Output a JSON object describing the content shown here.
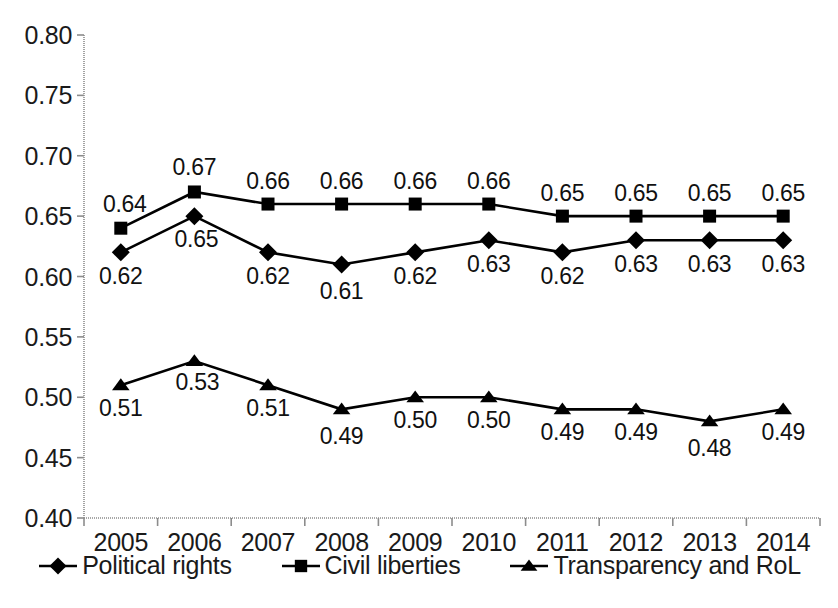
{
  "chart_data": {
    "type": "line",
    "title": "",
    "subtitle": "",
    "xlabel": "",
    "ylabel": "",
    "categories": [
      "2005",
      "2006",
      "2007",
      "2008",
      "2009",
      "2010",
      "2011",
      "2012",
      "2013",
      "2014"
    ],
    "ylim": [
      0.4,
      0.8
    ],
    "ytick_labels": [
      "0.80",
      "0.75",
      "0.70",
      "0.65",
      "0.60",
      "0.55",
      "0.50",
      "0.45",
      "0.40"
    ],
    "ytick_values": [
      0.8,
      0.75,
      0.7,
      0.65,
      0.6,
      0.55,
      0.5,
      0.45,
      0.4
    ],
    "grid": false,
    "legend_position": "bottom",
    "series": [
      {
        "name": "Political rights",
        "marker": "diamond",
        "color": "#000000",
        "values": [
          0.62,
          0.65,
          0.62,
          0.61,
          0.62,
          0.63,
          0.62,
          0.63,
          0.63,
          0.63
        ],
        "labels": [
          "0.62",
          "0.65",
          "0.62",
          "0.61",
          "0.62",
          "0.63",
          "0.62",
          "0.63",
          "0.63",
          "0.63"
        ],
        "label_positions": [
          "below",
          "below",
          "below",
          "below",
          "below",
          "below",
          "below",
          "below",
          "below",
          "below"
        ]
      },
      {
        "name": "Civil liberties",
        "marker": "square",
        "color": "#000000",
        "values": [
          0.64,
          0.67,
          0.66,
          0.66,
          0.66,
          0.66,
          0.65,
          0.65,
          0.65,
          0.65
        ],
        "labels": [
          "0.64",
          "0.67",
          "0.66",
          "0.66",
          "0.66",
          "0.66",
          "0.65",
          "0.65",
          "0.65",
          "0.65"
        ],
        "label_positions": [
          "above",
          "above",
          "above",
          "above",
          "above",
          "above",
          "above",
          "above",
          "above",
          "above"
        ]
      },
      {
        "name": "Transparency and  RoL",
        "marker": "triangle",
        "color": "#000000",
        "values": [
          0.51,
          0.53,
          0.51,
          0.49,
          0.5,
          0.5,
          0.49,
          0.49,
          0.48,
          0.49
        ],
        "labels": [
          "0.51",
          "0.53",
          "0.51",
          "0.49",
          "0.50",
          "0.50",
          "0.49",
          "0.49",
          "0.48",
          "0.49"
        ],
        "label_positions": [
          "below",
          "below",
          "below",
          "below",
          "below",
          "below",
          "below",
          "below",
          "below",
          "below"
        ]
      }
    ]
  },
  "axis": {
    "line_color": "#8c8c8c"
  }
}
